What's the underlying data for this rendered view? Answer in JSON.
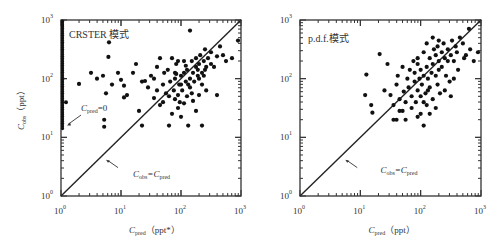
{
  "chart_data": [
    {
      "type": "scatter",
      "panel": "left",
      "title": "CRSTER 模式",
      "xlabel": "C_pred (ppt*)",
      "ylabel": "C_obs (ppt)",
      "xscale": "log",
      "yscale": "log",
      "xlim": [
        1,
        1000
      ],
      "ylim": [
        1,
        1000
      ],
      "xticks": [
        "10^0",
        "10^1",
        "10^2",
        "10^3"
      ],
      "yticks": [
        "10^0",
        "10^1",
        "10^2",
        "10^3"
      ],
      "reference_line": {
        "label": "C_obs=C_pred",
        "from": [
          1,
          1
        ],
        "to": [
          1000,
          1000
        ]
      },
      "annotations": [
        {
          "text": "C_pred=0",
          "points_to": [
            1,
            15
          ]
        },
        {
          "text": "C_obs=C_pred",
          "points_to": [
            6,
            6
          ]
        }
      ],
      "points_log10": [
        [
          0.85,
          1.9
        ],
        [
          0.8,
          2.62
        ],
        [
          0.79,
          2.37
        ],
        [
          0.3,
          1.91
        ],
        [
          0.6,
          2.0
        ],
        [
          0.7,
          2.05
        ],
        [
          0.5,
          2.1
        ],
        [
          0.75,
          1.75
        ],
        [
          0.72,
          1.3
        ],
        [
          0.72,
          1.18
        ],
        [
          0.95,
          2.1
        ],
        [
          1.0,
          1.98
        ],
        [
          1.05,
          1.88
        ],
        [
          1.05,
          1.68
        ],
        [
          1.1,
          1.72
        ],
        [
          1.2,
          2.1
        ],
        [
          1.25,
          2.25
        ],
        [
          1.35,
          1.95
        ],
        [
          1.3,
          1.45
        ],
        [
          1.35,
          1.2
        ],
        [
          1.4,
          1.96
        ],
        [
          1.45,
          1.85
        ],
        [
          1.5,
          2.05
        ],
        [
          1.55,
          1.67
        ],
        [
          1.55,
          2.0
        ],
        [
          1.6,
          1.8
        ],
        [
          1.65,
          2.35
        ],
        [
          1.6,
          2.2
        ],
        [
          1.65,
          1.55
        ],
        [
          1.7,
          1.6
        ],
        [
          1.7,
          1.9
        ],
        [
          1.72,
          2.1
        ],
        [
          1.75,
          1.75
        ],
        [
          1.78,
          2.15
        ],
        [
          1.8,
          1.7
        ],
        [
          1.8,
          1.2
        ],
        [
          1.82,
          1.95
        ],
        [
          1.85,
          2.35
        ],
        [
          1.85,
          1.4
        ],
        [
          1.88,
          1.8
        ],
        [
          1.9,
          1.65
        ],
        [
          1.9,
          2.0
        ],
        [
          1.92,
          2.25
        ],
        [
          1.95,
          1.5
        ],
        [
          1.95,
          1.72
        ],
        [
          1.97,
          1.9
        ],
        [
          2.0,
          2.05
        ],
        [
          2.0,
          1.35
        ],
        [
          2.02,
          1.8
        ],
        [
          2.05,
          2.1
        ],
        [
          2.05,
          1.58
        ],
        [
          2.08,
          1.95
        ],
        [
          2.1,
          1.7
        ],
        [
          2.1,
          2.15
        ],
        [
          2.12,
          1.2
        ],
        [
          2.15,
          2.0
        ],
        [
          2.15,
          1.85
        ],
        [
          2.18,
          2.3
        ],
        [
          2.2,
          1.62
        ],
        [
          2.2,
          2.1
        ],
        [
          2.22,
          1.95
        ],
        [
          2.25,
          2.2
        ],
        [
          2.25,
          1.45
        ],
        [
          2.28,
          2.05
        ],
        [
          2.3,
          2.25
        ],
        [
          2.3,
          1.72
        ],
        [
          2.32,
          2.4
        ],
        [
          2.35,
          2.1
        ],
        [
          2.35,
          1.2
        ],
        [
          2.38,
          2.3
        ],
        [
          2.4,
          2.15
        ],
        [
          2.4,
          2.5
        ],
        [
          2.42,
          1.8
        ],
        [
          2.45,
          2.35
        ],
        [
          2.5,
          2.25
        ],
        [
          2.5,
          2.45
        ],
        [
          2.55,
          2.2
        ],
        [
          2.6,
          2.38
        ],
        [
          2.6,
          1.72
        ],
        [
          2.65,
          2.55
        ],
        [
          2.7,
          2.4
        ],
        [
          2.75,
          2.3
        ],
        [
          2.85,
          2.35
        ],
        [
          2.95,
          2.65
        ],
        [
          2.15,
          2.82
        ],
        [
          1.95,
          2.3
        ],
        [
          1.9,
          2.1
        ],
        [
          1.98,
          1.6
        ],
        [
          2.05,
          2.3
        ],
        [
          2.12,
          1.9
        ],
        [
          2.18,
          1.75
        ],
        [
          2.25,
          2.35
        ],
        [
          2.3,
          2.0
        ],
        [
          2.35,
          1.9
        ],
        [
          2.38,
          2.05
        ],
        [
          2.42,
          2.2
        ],
        [
          2.0,
          1.9
        ],
        [
          1.92,
          2.08
        ],
        [
          2.08,
          2.22
        ],
        [
          2.28,
          2.15
        ]
      ],
      "zero_pred_column_log10_y_range": [
        1.15,
        3.0
      ]
    },
    {
      "type": "scatter",
      "panel": "right",
      "title": "p.d.f.模式",
      "xlabel": "C_pred (ppt)",
      "ylabel": "",
      "xscale": "log",
      "yscale": "log",
      "xlim": [
        1,
        1000
      ],
      "ylim": [
        1,
        1000
      ],
      "xticks": [
        "10^0",
        "10^1",
        "10^2",
        "10^3"
      ],
      "yticks": [
        "10^0",
        "10^1",
        "10^2",
        "10^3"
      ],
      "reference_line": {
        "label": "C_obs=C_pred",
        "from": [
          1,
          1
        ],
        "to": [
          1000,
          1000
        ]
      },
      "annotations": [
        {
          "text": "C_obs=C_pred",
          "points_to": [
            6,
            6
          ]
        }
      ],
      "points_log10": [
        [
          1.32,
          2.42
        ],
        [
          1.1,
          2.07
        ],
        [
          1.08,
          1.72
        ],
        [
          1.18,
          1.55
        ],
        [
          1.2,
          1.42
        ],
        [
          1.45,
          2.25
        ],
        [
          1.4,
          1.8
        ],
        [
          1.5,
          1.72
        ],
        [
          1.55,
          1.55
        ],
        [
          1.6,
          1.9
        ],
        [
          1.62,
          2.05
        ],
        [
          1.65,
          1.65
        ],
        [
          1.65,
          1.45
        ],
        [
          1.7,
          2.2
        ],
        [
          1.72,
          1.78
        ],
        [
          1.75,
          1.6
        ],
        [
          1.75,
          1.3
        ],
        [
          1.78,
          2.0
        ],
        [
          1.8,
          1.85
        ],
        [
          1.82,
          2.15
        ],
        [
          1.85,
          1.7
        ],
        [
          1.85,
          1.5
        ],
        [
          1.88,
          2.3
        ],
        [
          1.9,
          1.95
        ],
        [
          1.9,
          2.1
        ],
        [
          1.92,
          1.6
        ],
        [
          1.95,
          1.8
        ],
        [
          1.95,
          2.25
        ],
        [
          1.98,
          2.0
        ],
        [
          2.0,
          1.4
        ],
        [
          2.0,
          2.15
        ],
        [
          2.02,
          1.9
        ],
        [
          2.05,
          2.05
        ],
        [
          2.05,
          2.45
        ],
        [
          2.08,
          1.75
        ],
        [
          2.1,
          2.2
        ],
        [
          2.1,
          1.55
        ],
        [
          2.12,
          2.0
        ],
        [
          2.15,
          2.35
        ],
        [
          2.15,
          1.85
        ],
        [
          2.18,
          2.1
        ],
        [
          2.2,
          2.25
        ],
        [
          2.2,
          1.65
        ],
        [
          2.22,
          2.5
        ],
        [
          2.25,
          2.05
        ],
        [
          2.25,
          2.4
        ],
        [
          2.28,
          1.9
        ],
        [
          2.3,
          2.3
        ],
        [
          2.3,
          2.15
        ],
        [
          2.32,
          1.75
        ],
        [
          2.35,
          2.45
        ],
        [
          2.35,
          2.2
        ],
        [
          2.38,
          2.6
        ],
        [
          2.4,
          2.35
        ],
        [
          2.42,
          2.05
        ],
        [
          2.45,
          2.5
        ],
        [
          2.45,
          2.3
        ],
        [
          2.48,
          1.95
        ],
        [
          2.5,
          2.4
        ],
        [
          2.52,
          2.65
        ],
        [
          2.55,
          2.3
        ],
        [
          2.58,
          2.55
        ],
        [
          2.6,
          2.45
        ],
        [
          2.62,
          2.15
        ],
        [
          2.65,
          2.7
        ],
        [
          2.7,
          2.6
        ],
        [
          2.72,
          2.35
        ],
        [
          2.75,
          2.4
        ],
        [
          2.8,
          2.85
        ],
        [
          2.82,
          2.5
        ],
        [
          2.88,
          2.3
        ],
        [
          2.95,
          2.45
        ],
        [
          1.95,
          1.35
        ],
        [
          2.05,
          1.2
        ],
        [
          2.15,
          1.4
        ],
        [
          2.25,
          1.5
        ],
        [
          1.6,
          1.3
        ],
        [
          1.7,
          1.45
        ],
        [
          1.55,
          1.3
        ],
        [
          2.4,
          1.8
        ],
        [
          2.5,
          1.7
        ],
        [
          2.55,
          2.0
        ],
        [
          2.0,
          1.7
        ],
        [
          1.95,
          2.35
        ],
        [
          2.1,
          2.6
        ],
        [
          2.2,
          2.7
        ],
        [
          2.3,
          2.65
        ],
        [
          2.05,
          1.6
        ],
        [
          2.12,
          1.8
        ],
        [
          2.28,
          2.55
        ]
      ]
    }
  ],
  "page": {
    "left_title": "CRSTER 模式",
    "right_title": "p.d.f.模式",
    "y_label_main": "C",
    "y_label_sub": "obs",
    "y_label_unit": "（ppt）",
    "left_x_main": "C",
    "left_x_sub": "pred",
    "left_x_unit": "（ppt*）",
    "right_x_main": "C",
    "right_x_sub": "pred",
    "right_x_unit": "（ppt）",
    "ann_zero_main": "C",
    "ann_zero_sub": "pred",
    "ann_zero_eq": "=0",
    "ann_line_obs": "C",
    "ann_line_obs_sub": "obs",
    "ann_line_eq": "=C",
    "ann_line_pred_sub": "pred",
    "tick_base": "10",
    "tick_exps": [
      "0",
      "1",
      "2",
      "3"
    ]
  }
}
